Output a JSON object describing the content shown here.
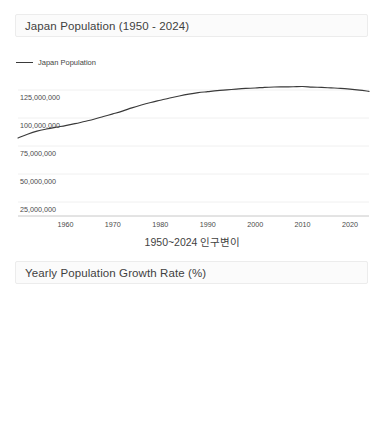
{
  "caption": "1950~2024 인구변이",
  "colors": {
    "line": "#3a3a3a",
    "grid": "#f0f0f0",
    "axis": "#c8c8c8",
    "zero_line": "#aaaaaa",
    "title_bg": "#fbfbfb",
    "title_border": "#ececec",
    "text": "#4a4a4a"
  },
  "chart1": {
    "title": "Japan Population (1950 - 2024)",
    "legend_label": "Japan Population"
  },
  "chart2": {
    "title": "Yearly Population Growth Rate (%)",
    "legend_label": "Yearly Growth Rate (%)"
  },
  "chart_data": [
    {
      "type": "line",
      "title": "Japan Population (1950 - 2024)",
      "xlabel": "",
      "ylabel": "",
      "grid": true,
      "legend": [
        "Japan Population"
      ],
      "legend_position": "top-left",
      "xlim": [
        1950,
        2024
      ],
      "ylim": [
        12500000,
        137500000
      ],
      "xticks": [
        1960,
        1970,
        1980,
        1990,
        2000,
        2010,
        2020
      ],
      "xticklabels": [
        "1960",
        "1970",
        "1980",
        "1990",
        "2000",
        "2010",
        "2020"
      ],
      "yticks": [
        25000000,
        50000000,
        75000000,
        100000000,
        125000000
      ],
      "yticklabels": [
        "25,000,000",
        "50,000,000",
        "75,000,000",
        "100,000,000",
        "125,000,000"
      ],
      "series": [
        {
          "name": "Japan Population",
          "x": [
            1950,
            1952,
            1954,
            1956,
            1958,
            1960,
            1962,
            1964,
            1966,
            1968,
            1970,
            1972,
            1974,
            1976,
            1978,
            1980,
            1982,
            1984,
            1986,
            1988,
            1990,
            1992,
            1994,
            1996,
            1998,
            2000,
            2002,
            2004,
            2006,
            2008,
            2010,
            2012,
            2014,
            2016,
            2018,
            2020,
            2022,
            2024
          ],
          "values": [
            82199000,
            85503000,
            88254000,
            90172000,
            91767000,
            93216000,
            94930000,
            96903000,
            98885000,
            101331000,
            103708000,
            106180000,
            109000000,
            111570000,
            113860000,
            115900000,
            117900000,
            119700000,
            121300000,
            122600000,
            123500000,
            124400000,
            125100000,
            125800000,
            126400000,
            126800000,
            127400000,
            127700000,
            127800000,
            127900000,
            128100000,
            127600000,
            127300000,
            126900000,
            126500000,
            125800000,
            124900000,
            123800000
          ]
        }
      ]
    },
    {
      "type": "line",
      "title": "Yearly Population Growth Rate (%)",
      "xlabel": "",
      "ylabel": "",
      "grid": true,
      "legend": [
        "Yearly Growth Rate (%)"
      ],
      "legend_position": "top-left",
      "xlim": [
        1950,
        2024
      ],
      "ylim": [
        -0.75,
        2.3
      ],
      "xticks": [
        1960,
        1970,
        1980,
        1990,
        2000,
        2010,
        2020
      ],
      "xticklabels": [
        "1960",
        "1970",
        "1980",
        "1990",
        "2000",
        "2010",
        "2020"
      ],
      "yticks": [
        0,
        1
      ],
      "yticklabels": [
        "0",
        "1"
      ],
      "series": [
        {
          "name": "Yearly Growth Rate (%)",
          "x": [
            1951,
            1953,
            1955,
            1957,
            1959,
            1961,
            1963,
            1965,
            1967,
            1969,
            1971,
            1973,
            1975,
            1977,
            1979,
            1981,
            1983,
            1985,
            1987,
            1989,
            1991,
            1993,
            1995,
            1997,
            1999,
            2001,
            2003,
            2005,
            2007,
            2009,
            2011,
            2013,
            2015,
            2017,
            2019,
            2021,
            2023,
            2024
          ],
          "values": [
            2.15,
            1.72,
            1.23,
            0.93,
            0.92,
            0.96,
            1.02,
            1.06,
            1.13,
            1.18,
            1.38,
            1.35,
            1.42,
            1.35,
            1.12,
            0.89,
            0.73,
            0.7,
            0.72,
            0.73,
            0.7,
            0.63,
            0.57,
            0.47,
            0.39,
            0.33,
            0.28,
            0.2,
            0.14,
            0.07,
            -0.02,
            -0.18,
            -0.12,
            -0.16,
            -0.3,
            -0.5,
            -0.46,
            -0.44
          ]
        }
      ]
    }
  ]
}
